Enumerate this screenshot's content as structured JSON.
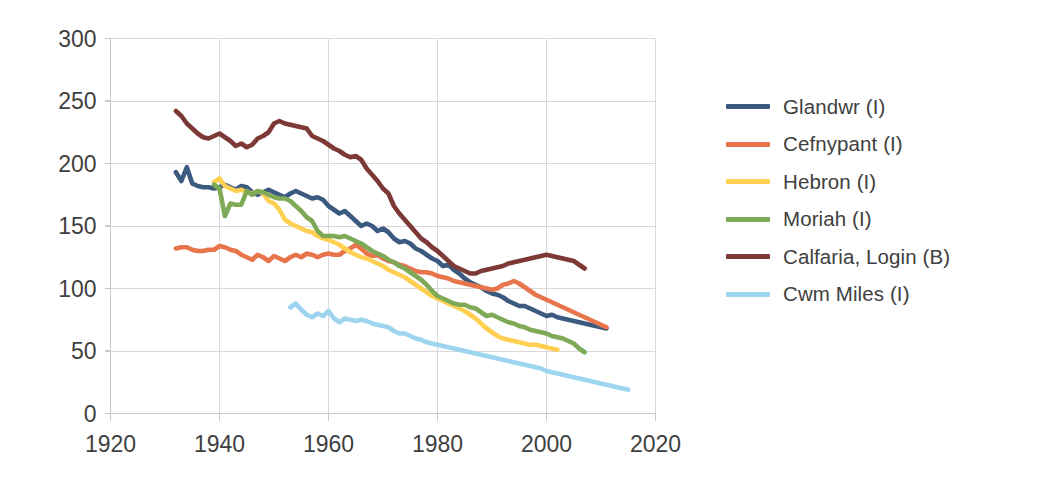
{
  "chart_data": {
    "type": "line",
    "title": "",
    "subtitle": "",
    "xlabel": "",
    "ylabel": "",
    "xlim": [
      1920,
      2020
    ],
    "ylim": [
      0,
      300
    ],
    "xticks": [
      1920,
      1940,
      1960,
      1980,
      2000,
      2020
    ],
    "yticks": [
      0,
      50,
      100,
      150,
      200,
      250,
      300
    ],
    "xtick_labels": [
      "1920",
      "1940",
      "1960",
      "1980",
      "2000",
      "2020"
    ],
    "ytick_labels": [
      "0",
      "50",
      "100",
      "150",
      "200",
      "250",
      "300"
    ],
    "grid": true,
    "grid_axis": "both",
    "legend_position": "right",
    "series": [
      {
        "name": "Glandwr (I)",
        "color": "#3C5A80",
        "x": [
          1932,
          1933,
          1934,
          1935,
          1936,
          1937,
          1938,
          1939,
          1940,
          1941,
          1942,
          1943,
          1944,
          1945,
          1946,
          1947,
          1948,
          1949,
          1950,
          1951,
          1952,
          1953,
          1954,
          1955,
          1956,
          1957,
          1958,
          1959,
          1960,
          1961,
          1962,
          1963,
          1964,
          1965,
          1966,
          1967,
          1968,
          1969,
          1970,
          1971,
          1972,
          1973,
          1974,
          1975,
          1976,
          1977,
          1978,
          1979,
          1980,
          1981,
          1982,
          1983,
          1984,
          1985,
          1986,
          1987,
          1988,
          1989,
          1990,
          1991,
          1992,
          1993,
          1994,
          1995,
          1996,
          1997,
          1998,
          1999,
          2000,
          2001,
          2002,
          2003,
          2004,
          2005,
          2006,
          2007,
          2008,
          2009,
          2010,
          2011
        ],
        "y": [
          193,
          186,
          197,
          184,
          182,
          181,
          181,
          180,
          181,
          183,
          181,
          179,
          182,
          181,
          177,
          175,
          177,
          179,
          177,
          175,
          173,
          176,
          178,
          176,
          174,
          172,
          173,
          171,
          166,
          163,
          160,
          162,
          158,
          154,
          150,
          152,
          150,
          146,
          148,
          145,
          140,
          137,
          138,
          136,
          132,
          130,
          127,
          124,
          122,
          118,
          119,
          115,
          112,
          108,
          105,
          103,
          101,
          98,
          96,
          95,
          93,
          90,
          88,
          86,
          86,
          84,
          82,
          80,
          78,
          79,
          77,
          76,
          75,
          74,
          73,
          72,
          71,
          70,
          69,
          68
        ]
      },
      {
        "name": "Cefnypant (I)",
        "color": "#E8744B",
        "x": [
          1932,
          1933,
          1934,
          1935,
          1936,
          1937,
          1938,
          1939,
          1940,
          1941,
          1942,
          1943,
          1944,
          1945,
          1946,
          1947,
          1948,
          1949,
          1950,
          1951,
          1952,
          1953,
          1954,
          1955,
          1956,
          1957,
          1958,
          1959,
          1960,
          1961,
          1962,
          1963,
          1964,
          1965,
          1966,
          1967,
          1968,
          1969,
          1970,
          1971,
          1972,
          1973,
          1974,
          1975,
          1976,
          1977,
          1978,
          1979,
          1980,
          1981,
          1982,
          1983,
          1984,
          1985,
          1986,
          1987,
          1988,
          1989,
          1990,
          1991,
          1992,
          1993,
          1994,
          1995,
          1996,
          1997,
          1998,
          1999,
          2000,
          2001,
          2002,
          2003,
          2004,
          2005,
          2006,
          2007,
          2008,
          2009,
          2010,
          2011
        ],
        "y": [
          132,
          133,
          133,
          131,
          130,
          130,
          131,
          131,
          134,
          133,
          131,
          130,
          127,
          125,
          123,
          127,
          125,
          122,
          126,
          124,
          122,
          125,
          127,
          125,
          128,
          127,
          125,
          127,
          128,
          127,
          127,
          130,
          132,
          135,
          132,
          128,
          126,
          127,
          124,
          122,
          121,
          119,
          118,
          116,
          114,
          113,
          113,
          112,
          110,
          109,
          108,
          106,
          105,
          104,
          103,
          102,
          101,
          100,
          99,
          100,
          103,
          104,
          106,
          104,
          101,
          98,
          95,
          93,
          91,
          89,
          87,
          85,
          83,
          81,
          79,
          77,
          75,
          73,
          71,
          69
        ]
      },
      {
        "name": "Hebron (I)",
        "color": "#FFCF52",
        "x": [
          1939,
          1940,
          1941,
          1942,
          1943,
          1944,
          1945,
          1946,
          1947,
          1948,
          1949,
          1950,
          1951,
          1952,
          1953,
          1954,
          1955,
          1956,
          1957,
          1958,
          1959,
          1960,
          1961,
          1962,
          1963,
          1964,
          1965,
          1966,
          1967,
          1968,
          1969,
          1970,
          1971,
          1972,
          1973,
          1974,
          1975,
          1976,
          1977,
          1978,
          1979,
          1980,
          1981,
          1982,
          1983,
          1984,
          1985,
          1986,
          1987,
          1988,
          1989,
          1990,
          1991,
          1992,
          1993,
          1994,
          1995,
          1996,
          1997,
          1998,
          1999,
          2000,
          2001,
          2002
        ],
        "y": [
          185,
          188,
          182,
          180,
          178,
          179,
          177,
          176,
          178,
          176,
          170,
          168,
          163,
          155,
          152,
          150,
          148,
          146,
          145,
          142,
          140,
          139,
          137,
          135,
          132,
          129,
          127,
          125,
          124,
          122,
          120,
          118,
          115,
          113,
          111,
          109,
          106,
          103,
          100,
          97,
          94,
          92,
          90,
          88,
          86,
          84,
          82,
          79,
          76,
          72,
          68,
          65,
          62,
          60,
          59,
          58,
          57,
          56,
          55,
          55,
          54,
          53,
          52,
          51
        ]
      },
      {
        "name": "Moriah (I)",
        "color": "#7EA956",
        "x": [
          1939,
          1940,
          1941,
          1942,
          1943,
          1944,
          1945,
          1946,
          1947,
          1948,
          1949,
          1950,
          1951,
          1952,
          1953,
          1954,
          1955,
          1956,
          1957,
          1958,
          1959,
          1960,
          1961,
          1962,
          1963,
          1964,
          1965,
          1966,
          1967,
          1968,
          1969,
          1970,
          1971,
          1972,
          1973,
          1974,
          1975,
          1976,
          1977,
          1978,
          1979,
          1980,
          1981,
          1982,
          1983,
          1984,
          1985,
          1986,
          1987,
          1988,
          1989,
          1990,
          1991,
          1992,
          1993,
          1994,
          1995,
          1996,
          1997,
          1998,
          1999,
          2000,
          2001,
          2002,
          2003,
          2004,
          2005,
          2006,
          2007
        ],
        "y": [
          183,
          180,
          158,
          168,
          167,
          167,
          178,
          175,
          178,
          177,
          175,
          173,
          172,
          172,
          170,
          166,
          162,
          157,
          154,
          146,
          142,
          142,
          142,
          141,
          142,
          140,
          138,
          136,
          133,
          130,
          128,
          126,
          123,
          121,
          118,
          116,
          113,
          110,
          107,
          103,
          98,
          94,
          92,
          90,
          88,
          87,
          87,
          85,
          84,
          81,
          78,
          79,
          77,
          75,
          73,
          72,
          70,
          69,
          67,
          66,
          65,
          64,
          62,
          61,
          60,
          58,
          56,
          52,
          49
        ]
      },
      {
        "name": "Calfaria, Login (B)",
        "color": "#7C3935",
        "x": [
          1932,
          1933,
          1934,
          1935,
          1936,
          1937,
          1938,
          1939,
          1940,
          1941,
          1942,
          1943,
          1944,
          1945,
          1946,
          1947,
          1948,
          1949,
          1950,
          1951,
          1952,
          1953,
          1954,
          1955,
          1956,
          1957,
          1958,
          1959,
          1960,
          1961,
          1962,
          1963,
          1964,
          1965,
          1966,
          1967,
          1968,
          1969,
          1970,
          1971,
          1972,
          1973,
          1974,
          1975,
          1976,
          1977,
          1978,
          1979,
          1980,
          1981,
          1982,
          1983,
          1984,
          1985,
          1986,
          1987,
          1988,
          1989,
          1990,
          1991,
          1992,
          1993,
          1994,
          1995,
          1996,
          1997,
          1998,
          1999,
          2000,
          2001,
          2002,
          2003,
          2004,
          2005,
          2006,
          2007
        ],
        "y": [
          242,
          238,
          232,
          228,
          224,
          221,
          220,
          222,
          224,
          221,
          218,
          214,
          216,
          213,
          215,
          220,
          222,
          225,
          232,
          234,
          232,
          231,
          230,
          229,
          228,
          222,
          220,
          218,
          215,
          212,
          210,
          207,
          205,
          206,
          203,
          196,
          191,
          186,
          180,
          176,
          166,
          160,
          155,
          150,
          145,
          140,
          137,
          133,
          130,
          126,
          122,
          118,
          116,
          114,
          112,
          112,
          114,
          115,
          116,
          117,
          118,
          120,
          121,
          122,
          123,
          124,
          125,
          126,
          127,
          126,
          125,
          124,
          123,
          122,
          119,
          116
        ]
      },
      {
        "name": "Cwm Miles (I)",
        "color": "#9DD5F0",
        "x": [
          1953,
          1954,
          1955,
          1956,
          1957,
          1958,
          1959,
          1960,
          1961,
          1962,
          1963,
          1964,
          1965,
          1966,
          1967,
          1968,
          1969,
          1970,
          1971,
          1972,
          1973,
          1974,
          1975,
          1976,
          1977,
          1978,
          1979,
          1980,
          1981,
          1982,
          1983,
          1984,
          1985,
          1986,
          1987,
          1988,
          1989,
          1990,
          1991,
          1992,
          1993,
          1994,
          1995,
          1996,
          1997,
          1998,
          1999,
          2000,
          2001,
          2002,
          2003,
          2004,
          2005,
          2006,
          2007,
          2008,
          2009,
          2010,
          2011,
          2012,
          2013,
          2014,
          2015
        ],
        "y": [
          85,
          88,
          83,
          79,
          77,
          80,
          78,
          82,
          76,
          73,
          76,
          75,
          74,
          75,
          74,
          72,
          71,
          70,
          69,
          66,
          64,
          64,
          62,
          60,
          59,
          57,
          56,
          55,
          54,
          53,
          52,
          51,
          50,
          49,
          48,
          47,
          46,
          45,
          44,
          43,
          42,
          41,
          40,
          39,
          38,
          37,
          36,
          34,
          33,
          32,
          31,
          30,
          29,
          28,
          27,
          26,
          25,
          24,
          23,
          22,
          21,
          20,
          19
        ]
      }
    ]
  },
  "legend": {
    "items": [
      {
        "label": "Glandwr (I)",
        "color": "#3C5A80"
      },
      {
        "label": "Cefnypant (I)",
        "color": "#E8744B"
      },
      {
        "label": "Hebron (I)",
        "color": "#FFCF52"
      },
      {
        "label": "Moriah (I)",
        "color": "#7EA956"
      },
      {
        "label": "Calfaria, Login (B)",
        "color": "#7C3935"
      },
      {
        "label": "Cwm Miles (I)",
        "color": "#9DD5F0"
      }
    ]
  },
  "colors": {
    "background": "#ffffff",
    "gridline": "#d9d9d9",
    "axis": "#c9c9c9",
    "text": "#3f3f3f"
  }
}
